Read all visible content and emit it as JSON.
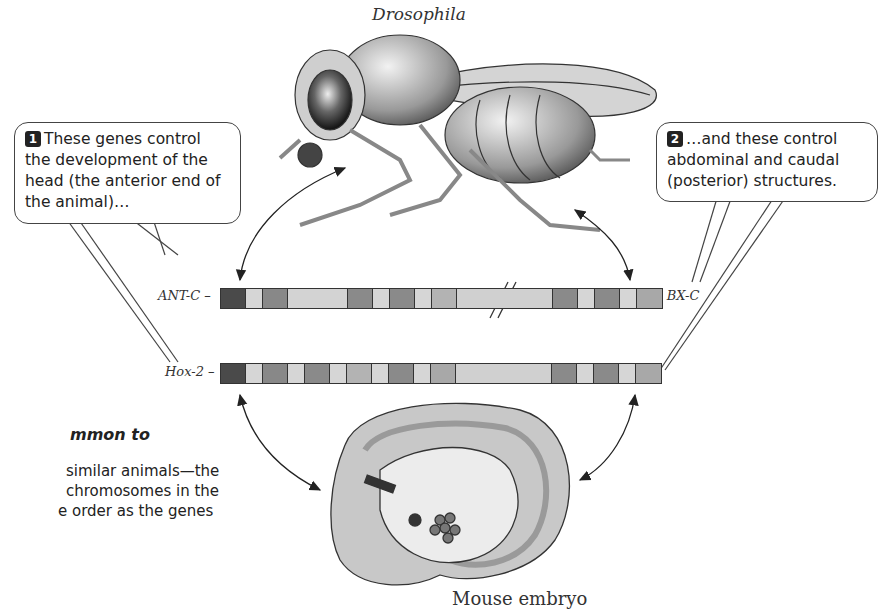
{
  "titles": {
    "fly": "Drosophila",
    "mouse": "Mouse embryo"
  },
  "callouts": [
    {
      "number": "1",
      "text": "These genes control the development of the head (the anterior end of the animal)…"
    },
    {
      "number": "2",
      "text": "…and these control abdominal and caudal (posterior) structures."
    }
  ],
  "gene_clusters": {
    "fly": {
      "left_label": "ANT-C",
      "right_label": "BX-C",
      "segments": [
        {
          "w": 25,
          "c": "#4a4a4a"
        },
        {
          "w": 17,
          "c": "#d6d6d6"
        },
        {
          "w": 25,
          "c": "#888888"
        },
        {
          "w": 60,
          "c": "#d3d3d3"
        },
        {
          "w": 25,
          "c": "#8a8a8a"
        },
        {
          "w": 17,
          "c": "#d6d6d6"
        },
        {
          "w": 25,
          "c": "#8a8a8a"
        },
        {
          "w": 17,
          "c": "#d6d6d6"
        },
        {
          "w": 25,
          "c": "#b3b3b3"
        },
        {
          "w": 96,
          "c": "#d0d0d0"
        },
        {
          "w": 25,
          "c": "#8a8a8a"
        },
        {
          "w": 17,
          "c": "#d6d6d6"
        },
        {
          "w": 25,
          "c": "#8a8a8a"
        },
        {
          "w": 17,
          "c": "#d6d6d6"
        },
        {
          "w": 25,
          "c": "#a8a8a8"
        }
      ]
    },
    "mouse": {
      "left_label": "Hox-2",
      "segments": [
        {
          "w": 25,
          "c": "#4a4a4a"
        },
        {
          "w": 17,
          "c": "#d6d6d6"
        },
        {
          "w": 25,
          "c": "#888888"
        },
        {
          "w": 17,
          "c": "#d6d6d6"
        },
        {
          "w": 25,
          "c": "#8a8a8a"
        },
        {
          "w": 17,
          "c": "#d6d6d6"
        },
        {
          "w": 25,
          "c": "#b3b3b3"
        },
        {
          "w": 17,
          "c": "#d6d6d6"
        },
        {
          "w": 25,
          "c": "#8a8a8a"
        },
        {
          "w": 17,
          "c": "#d6d6d6"
        },
        {
          "w": 25,
          "c": "#a8a8a8"
        },
        {
          "w": 96,
          "c": "#d0d0d0"
        },
        {
          "w": 25,
          "c": "#8a8a8a"
        },
        {
          "w": 17,
          "c": "#d6d6d6"
        },
        {
          "w": 25,
          "c": "#8a8a8a"
        },
        {
          "w": 17,
          "c": "#d6d6d6"
        },
        {
          "w": 25,
          "c": "#a8a8a8"
        }
      ]
    }
  },
  "side_text": {
    "heading": "mmon to",
    "lines": [
      "similar animals—the",
      "chromosomes in the",
      "e order as the genes"
    ]
  }
}
